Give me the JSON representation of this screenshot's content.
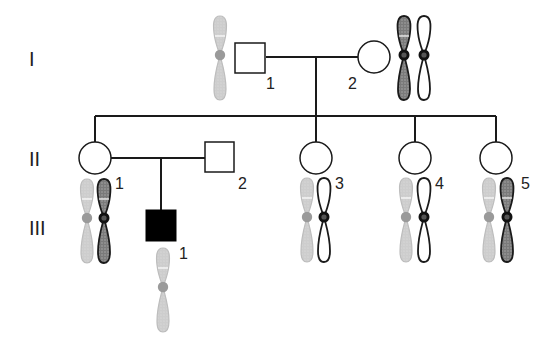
{
  "diagram": {
    "type": "pedigree",
    "colors": {
      "line": "#1a1a1a",
      "affected": "#000000",
      "unaffected_fill": "#ffffff",
      "chrom_gray": "#c8c8c8",
      "chrom_gray_centromere": "#9a9a9a",
      "chrom_dark": "#8a8a8a",
      "chrom_dark_outline": "#1a1a1a",
      "chrom_white": "#ffffff"
    },
    "generations": [
      {
        "label": "I",
        "y": 57
      },
      {
        "label": "II",
        "y": 158
      },
      {
        "label": "III",
        "y": 226
      }
    ],
    "individuals": [
      {
        "id": "I-1",
        "number": "1",
        "sex": "male",
        "affected": false,
        "x": 250,
        "y": 58,
        "chromosomes": [
          "gray"
        ]
      },
      {
        "id": "I-2",
        "number": "2",
        "sex": "female",
        "affected": false,
        "x": 374,
        "y": 57,
        "chromosomes": [
          "dark",
          "white"
        ]
      },
      {
        "id": "II-1",
        "number": "1",
        "sex": "female",
        "affected": false,
        "x": 95,
        "y": 158,
        "chromosomes": [
          "gray",
          "dark"
        ]
      },
      {
        "id": "II-2",
        "number": "2",
        "sex": "male",
        "affected": false,
        "x": 219,
        "y": 157,
        "chromosomes": []
      },
      {
        "id": "II-3",
        "number": "3",
        "sex": "female",
        "affected": false,
        "x": 316,
        "y": 158,
        "chromosomes": [
          "gray",
          "white"
        ]
      },
      {
        "id": "II-4",
        "number": "4",
        "sex": "female",
        "affected": false,
        "x": 415,
        "y": 158,
        "chromosomes": [
          "gray",
          "white"
        ]
      },
      {
        "id": "II-5",
        "number": "5",
        "sex": "female",
        "affected": false,
        "x": 496,
        "y": 158,
        "chromosomes": [
          "gray",
          "dark"
        ]
      },
      {
        "id": "III-1",
        "number": "1",
        "sex": "male",
        "affected": true,
        "x": 161,
        "y": 225,
        "chromosomes": [
          "gray"
        ]
      }
    ]
  }
}
